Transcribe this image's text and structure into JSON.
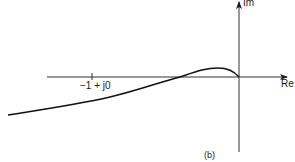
{
  "diagram": {
    "type": "nyquist-plot",
    "axes": {
      "real_label": "Re",
      "imag_label": "Im"
    },
    "critical_point_label": "−1 + j0",
    "subfigure_label": "(b)",
    "colors": {
      "ink": "#1a1a1a",
      "background": "#ffffff"
    }
  }
}
